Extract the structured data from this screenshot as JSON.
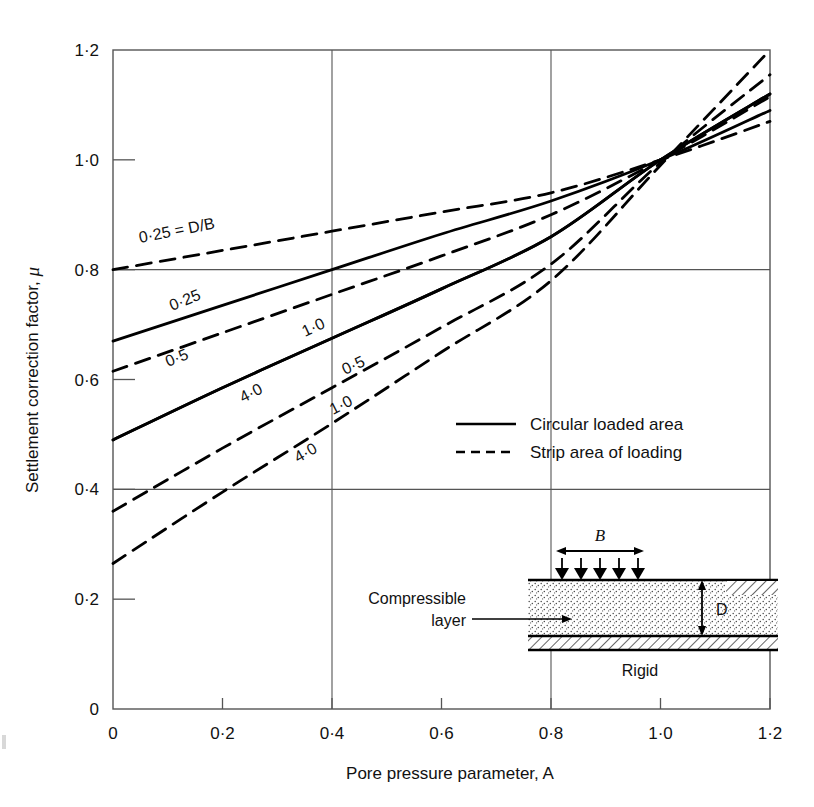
{
  "figure": {
    "name": "settlement-correction-factor-chart",
    "background": "#ffffff",
    "line_color": "#000000",
    "grid_color": "#555555",
    "axis_color": "#444444"
  },
  "axes": {
    "x": {
      "title": "Pore pressure parameter, A",
      "ticks": [
        "0",
        "0·2",
        "0·4",
        "0·6",
        "0·8",
        "1·0",
        "1·2"
      ],
      "tick_values": [
        0,
        0.2,
        0.4,
        0.6,
        0.8,
        1.0,
        1.2
      ],
      "min": 0,
      "max": 1.2
    },
    "y": {
      "title_prefix": "Settlement correction factor, ",
      "title_symbol": "μ",
      "ticks": [
        "0",
        "0·2",
        "0·4",
        "0·6",
        "0·8",
        "1·0",
        "1·2"
      ],
      "tick_values": [
        0,
        0.2,
        0.4,
        0.6,
        0.8,
        1.0,
        1.2
      ],
      "min": 0,
      "max": 1.2
    },
    "gridlines": {
      "vertical_at": [
        0.4,
        0.8
      ],
      "horizontal_at": [
        0.4,
        0.8
      ]
    }
  },
  "legend": {
    "position": "inside-right-middle",
    "entries": [
      {
        "label": "Circular loaded area",
        "style": "solid"
      },
      {
        "label": "Strip area of loading",
        "style": "dashed"
      }
    ]
  },
  "annotations": {
    "db_label": "0·25 = D/B"
  },
  "inset": {
    "name": "compressible-layer-diagram",
    "width_label": "B",
    "depth_label": "D",
    "base_label": "Rigid",
    "layer_label_line1": "Compressible",
    "layer_label_line2": "layer",
    "arrow_count": 5
  },
  "chart_data": {
    "type": "line",
    "title": "",
    "xlabel": "Pore pressure parameter, A",
    "ylabel": "Settlement correction factor, μ",
    "xlim": [
      0,
      1.2
    ],
    "ylim": [
      0,
      1.2
    ],
    "grid": true,
    "legend": [
      "Circular loaded area (solid)",
      "Strip area of loading (dashed)"
    ],
    "x": [
      0,
      0.2,
      0.4,
      0.6,
      0.8,
      1.0,
      1.2
    ],
    "series": [
      {
        "name": "Strip, D/B = 0.25",
        "style": "dashed",
        "label": "0·25 = D/B",
        "values": [
          0.8,
          0.835,
          0.87,
          0.905,
          0.94,
          1.0,
          1.07
        ]
      },
      {
        "name": "Circular, D/B = 0.25",
        "style": "solid",
        "label": "0·25",
        "values": [
          0.67,
          0.735,
          0.8,
          0.865,
          0.925,
          1.0,
          1.09
        ]
      },
      {
        "name": "Strip, D/B = 0.5",
        "style": "dashed",
        "label": "0·5",
        "values": [
          0.615,
          0.685,
          0.755,
          0.825,
          0.9,
          1.0,
          1.115
        ]
      },
      {
        "name": "Circular, D/B = 1.0",
        "style": "solid",
        "label": "1·0",
        "values": [
          0.49,
          0.585,
          0.675,
          0.765,
          0.86,
          1.0,
          1.12
        ]
      },
      {
        "name": "Circular, D/B = 4.0",
        "style": "solid",
        "label": "4·0",
        "values": [
          0.49,
          0.585,
          0.675,
          0.765,
          0.86,
          1.0,
          1.12
        ]
      },
      {
        "name": "Strip, D/B = 1.0",
        "style": "dashed",
        "label": "1·0",
        "values": [
          0.36,
          0.475,
          0.585,
          0.695,
          0.81,
          0.995,
          1.155
        ]
      },
      {
        "name": "Strip, D/B = 4.0",
        "style": "dashed",
        "label": "4·0",
        "values": [
          0.265,
          0.395,
          0.52,
          0.65,
          0.78,
          0.99,
          1.2
        ]
      }
    ]
  }
}
